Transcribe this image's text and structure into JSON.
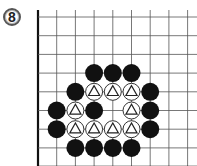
{
  "problem": {
    "number": "8"
  },
  "board": {
    "origin_x": 38,
    "origin_y": 17,
    "spacing": 18.7,
    "columns": 9,
    "rows": 9,
    "stone_radius": 9,
    "line_color": "#555555",
    "edge_color": "#111111",
    "black_color": "#111111",
    "white_fill": "#ffffff",
    "white_stroke": "#333333",
    "edges": [
      "left",
      "bottom"
    ]
  },
  "stones": [
    {
      "color": "black",
      "col": 3,
      "row": 3
    },
    {
      "color": "black",
      "col": 4,
      "row": 3
    },
    {
      "color": "black",
      "col": 5,
      "row": 3
    },
    {
      "color": "black",
      "col": 2,
      "row": 4
    },
    {
      "color": "white",
      "col": 3,
      "row": 4,
      "mark": "triangle"
    },
    {
      "color": "white",
      "col": 4,
      "row": 4,
      "mark": "triangle"
    },
    {
      "color": "white",
      "col": 5,
      "row": 4,
      "mark": "triangle"
    },
    {
      "color": "black",
      "col": 6,
      "row": 4
    },
    {
      "color": "black",
      "col": 1,
      "row": 5
    },
    {
      "color": "white",
      "col": 2,
      "row": 5,
      "mark": "triangle"
    },
    {
      "color": "black",
      "col": 3,
      "row": 5
    },
    {
      "color": "white",
      "col": 5,
      "row": 5,
      "mark": "triangle"
    },
    {
      "color": "black",
      "col": 6,
      "row": 5
    },
    {
      "color": "black",
      "col": 1,
      "row": 6
    },
    {
      "color": "white",
      "col": 2,
      "row": 6,
      "mark": "triangle"
    },
    {
      "color": "white",
      "col": 3,
      "row": 6,
      "mark": "triangle"
    },
    {
      "color": "white",
      "col": 4,
      "row": 6,
      "mark": "triangle"
    },
    {
      "color": "white",
      "col": 5,
      "row": 6,
      "mark": "triangle"
    },
    {
      "color": "black",
      "col": 6,
      "row": 6
    },
    {
      "color": "black",
      "col": 2,
      "row": 7
    },
    {
      "color": "black",
      "col": 3,
      "row": 7
    },
    {
      "color": "black",
      "col": 4,
      "row": 7
    },
    {
      "color": "black",
      "col": 5,
      "row": 7
    }
  ]
}
